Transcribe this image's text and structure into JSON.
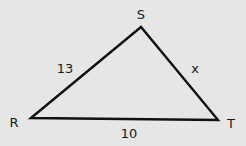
{
  "diagram": {
    "type": "triangle",
    "background": "#e6e6e6",
    "stroke_color": "#111111",
    "vertices": [
      {
        "name": "R",
        "x": 31,
        "y": 118,
        "label_x": 14,
        "label_y": 127
      },
      {
        "name": "S",
        "x": 141,
        "y": 27,
        "label_x": 141,
        "label_y": 19
      },
      {
        "name": "T",
        "x": 218,
        "y": 120,
        "label_x": 231,
        "label_y": 128
      }
    ],
    "sides": [
      {
        "from": "R",
        "to": "S",
        "label": "13",
        "label_x": 65,
        "label_y": 73
      },
      {
        "from": "S",
        "to": "T",
        "label": "x",
        "label_x": 195,
        "label_y": 73
      },
      {
        "from": "R",
        "to": "T",
        "label": "10",
        "label_x": 129,
        "label_y": 138
      }
    ]
  }
}
